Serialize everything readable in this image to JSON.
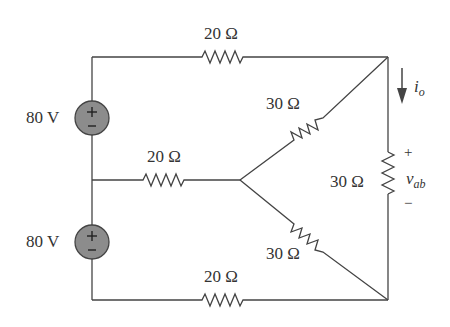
{
  "sources": [
    {
      "id": "v1",
      "label": "80 V",
      "plus": "+",
      "minus": "−"
    },
    {
      "id": "v2",
      "label": "80 V",
      "plus": "+",
      "minus": "−"
    }
  ],
  "resistors": {
    "top": "20 Ω",
    "middle": "20 Ω",
    "bottom": "20 Ω",
    "upper_diagonal": "30 Ω",
    "lower_diagonal": "30 Ω",
    "right_vertical": "30 Ω"
  },
  "current": {
    "label": "i",
    "subscript": "o"
  },
  "voltage": {
    "label": "v",
    "subscript": "ab",
    "plus": "+",
    "minus": "−"
  },
  "colors": {
    "wire": "#444444",
    "source_fill": "#8c8c8c",
    "text": "#333333"
  }
}
